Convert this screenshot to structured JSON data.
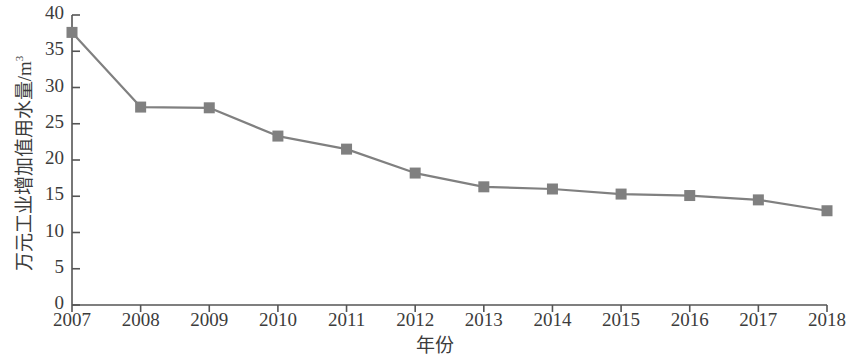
{
  "chart_data": {
    "type": "line",
    "title": "",
    "xlabel": "年份",
    "ylabel": "万元工业增加值用水量/m³",
    "ylabel_main": "万元工业增加值用水量/m",
    "ylabel_exponent": "3",
    "categories": [
      "2007",
      "2008",
      "2009",
      "2010",
      "2011",
      "2012",
      "2013",
      "2014",
      "2015",
      "2016",
      "2017",
      "2018"
    ],
    "values": [
      37.6,
      27.3,
      27.2,
      23.3,
      21.5,
      18.2,
      16.3,
      16.0,
      15.3,
      15.1,
      14.5,
      13.0
    ],
    "series": [
      {
        "name": "万元工业增加值用水量",
        "values": [
          37.6,
          27.3,
          27.2,
          23.3,
          21.5,
          18.2,
          16.3,
          16.0,
          15.3,
          15.1,
          14.5,
          13.0
        ]
      }
    ],
    "ylim": [
      0,
      40
    ],
    "yticks": [
      0,
      5,
      10,
      15,
      20,
      25,
      30,
      35,
      40
    ],
    "ytick_labels": [
      "0",
      "5",
      "10",
      "15",
      "20",
      "25",
      "30",
      "35",
      "40"
    ],
    "xtick_labels": [
      "2007",
      "2008",
      "2009",
      "2010",
      "2011",
      "2012",
      "2013",
      "2014",
      "2015",
      "2016",
      "2017",
      "2018"
    ],
    "grid": false,
    "legend": false,
    "legend_position": "none",
    "line_color": "#808080",
    "marker_color": "#808080",
    "marker_shape": "square",
    "axis_color": "#555555",
    "background_color": "#ffffff"
  }
}
